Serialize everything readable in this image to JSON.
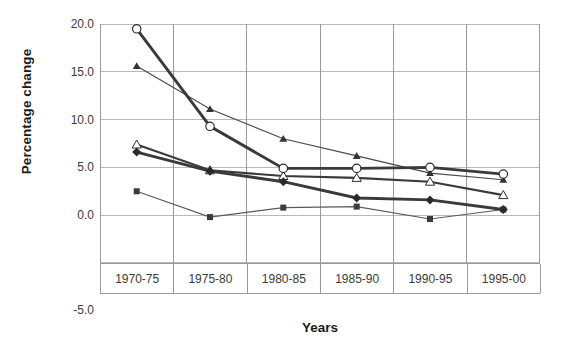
{
  "chart_data": {
    "type": "line",
    "title": "",
    "subtitle": "",
    "xlabel": "Years",
    "ylabel": "Percentage change",
    "categories": [
      "1970-75",
      "1975-80",
      "1980-85",
      "1985-90",
      "1990-95",
      "1995-00"
    ],
    "ylim": [
      -5.0,
      20.0
    ],
    "ytick_values": [
      20.0,
      15.0,
      10.0,
      5.0,
      0.0,
      -5.0
    ],
    "ytick_labels": [
      "20.0",
      "15.0",
      "10.0",
      "5.0",
      "0.0",
      "-5.0"
    ],
    "grid": true,
    "grid_axis": "both",
    "legend": false,
    "legend_position": "none",
    "series": [
      {
        "name": "series-1",
        "marker": "open-circle",
        "line_width": "thick",
        "color": "#3a3a3a",
        "values": [
          19.5,
          9.3,
          4.9,
          4.9,
          5.0,
          4.3
        ]
      },
      {
        "name": "series-2",
        "marker": "filled-triangle",
        "line_width": "thin",
        "color": "#4a4a4a",
        "values": [
          15.6,
          11.1,
          8.0,
          6.2,
          4.4,
          3.7
        ]
      },
      {
        "name": "series-3",
        "marker": "open-triangle",
        "line_width": "medium",
        "color": "#3a3a3a",
        "values": [
          7.4,
          4.7,
          4.1,
          3.9,
          3.5,
          2.1
        ]
      },
      {
        "name": "series-4",
        "marker": "filled-diamond",
        "line_width": "thick",
        "color": "#3a3a3a",
        "values": [
          6.6,
          4.6,
          3.5,
          1.8,
          1.6,
          0.6
        ]
      },
      {
        "name": "series-5",
        "marker": "filled-square",
        "line_width": "thin",
        "color": "#5a5a5a",
        "values": [
          2.5,
          -0.2,
          0.8,
          0.9,
          -0.4,
          0.6
        ]
      }
    ]
  },
  "axis": {
    "y_title": "Percentage change",
    "x_title": "Years",
    "ticks": {
      "t0": "20.0",
      "t1": "15.0",
      "t2": "10.0",
      "t3": "5.0",
      "t4": "0.0",
      "t5": "-5.0"
    },
    "categories": {
      "c0": "1970-75",
      "c1": "1975-80",
      "c2": "1980-85",
      "c3": "1985-90",
      "c4": "1990-95",
      "c5": "1995-00"
    }
  },
  "colors": {
    "grid": "#b9b9b9",
    "frame": "#8f8f8f",
    "ink": "#333333",
    "background": "#ffffff"
  }
}
